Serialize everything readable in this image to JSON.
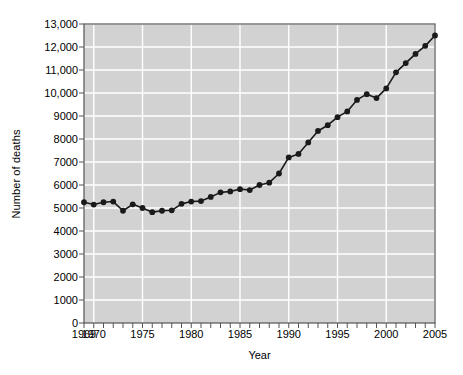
{
  "chart_data": {
    "type": "line",
    "title": "",
    "xlabel": "Year",
    "ylabel": "Number of deaths",
    "xlim": [
      1969,
      2005
    ],
    "ylim": [
      0,
      13000
    ],
    "grid": true,
    "legend": null,
    "plot_bg_color": "#d2d2d2",
    "grid_color": "#ffffff",
    "line_color": "#1a1a1a",
    "marker_color": "#1a1a1a",
    "marker": "circle",
    "x_tick_labels": [
      "1969",
      "1970",
      "1975",
      "1980",
      "1985",
      "1990",
      "1995",
      "2000",
      "2005"
    ],
    "x_tick_values": [
      1969,
      1970,
      1975,
      1980,
      1985,
      1990,
      1995,
      2000,
      2005
    ],
    "x_minor_ticks_every": 1,
    "y_tick_labels": [
      "0",
      "1000",
      "2000",
      "3000",
      "4000",
      "5000",
      "6000",
      "7000",
      "8000",
      "9000",
      "10,000",
      "11,000",
      "12,000",
      "13,000"
    ],
    "y_tick_values": [
      0,
      1000,
      2000,
      3000,
      4000,
      5000,
      6000,
      7000,
      8000,
      9000,
      10000,
      11000,
      12000,
      13000
    ],
    "x": [
      1969,
      1970,
      1971,
      1972,
      1973,
      1974,
      1975,
      1976,
      1977,
      1978,
      1979,
      1980,
      1981,
      1982,
      1983,
      1984,
      1985,
      1986,
      1987,
      1988,
      1989,
      1990,
      1991,
      1992,
      1993,
      1994,
      1995,
      1996,
      1997,
      1998,
      1999,
      2000,
      2001,
      2002,
      2003,
      2004,
      2005
    ],
    "values": [
      5250,
      5150,
      5250,
      5280,
      4880,
      5160,
      5000,
      4820,
      4880,
      4900,
      5180,
      5280,
      5300,
      5480,
      5680,
      5720,
      5820,
      5780,
      6000,
      6100,
      6500,
      7200,
      7350,
      7850,
      8350,
      8600,
      8950,
      9200,
      9700,
      9950,
      9780,
      10200,
      10900,
      11300,
      11700,
      12050,
      12500
    ]
  }
}
